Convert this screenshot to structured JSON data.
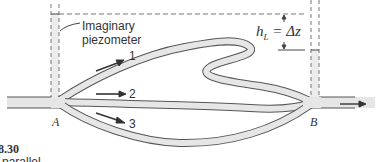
{
  "figure": {
    "callout": {
      "line1": "Imaginary",
      "line2": "piezometer"
    },
    "branches": [
      {
        "label": "1"
      },
      {
        "label": "2"
      },
      {
        "label": "3"
      }
    ],
    "junctions": {
      "a": "A",
      "b": "B"
    },
    "head_loss": {
      "symbol": "h",
      "subscript": "L",
      "rest": " = Δz"
    },
    "figure_number": "8.30",
    "caption_fragment": "n parallel",
    "colors": {
      "pipe_fill": "#e6e6e6",
      "pipe_stroke": "#555555",
      "piezometer_fill": "#ececec",
      "dash": "#777777"
    }
  }
}
